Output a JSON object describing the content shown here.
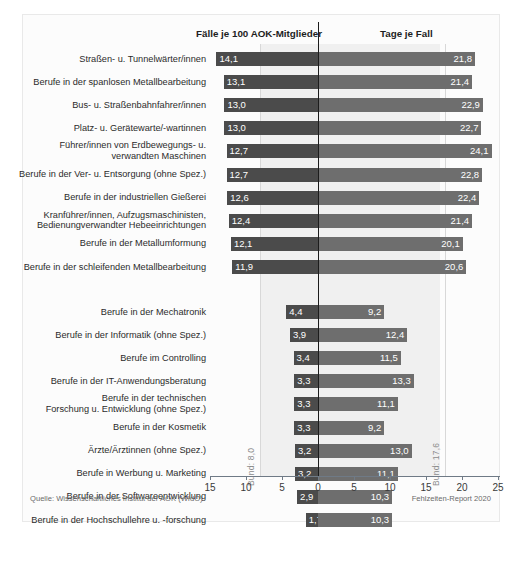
{
  "figure": {
    "headers": {
      "cases": "Fälle je 100 AOK-Mitglieder",
      "days": "Tage je Fall"
    },
    "source": "Quelle: Wissenschaftliches Institut der AOK (WIdO)",
    "report": "Fehlzeiten-Report 2020",
    "bund": {
      "cases_label": "Bund: 8,0",
      "days_label": "Bund: 17,6",
      "cases_value": 8.0,
      "days_value": 17.6
    },
    "colors": {
      "bar_left": "#4b4b4b",
      "bar_right": "#6e6e6e",
      "band": "#f0f0f0",
      "axis": "#6f7a86",
      "zero_axis": "#1c1c1c",
      "frame": "#e9e9e9"
    }
  },
  "chart_data": {
    "type": "bar",
    "title": "",
    "subtitle": "",
    "orientation": "horizontal",
    "layout": "diverging-bidirectional",
    "grid": false,
    "legend": "none",
    "xlabel_left": "Fälle je 100 AOK-Mitglieder",
    "xlabel_right": "Tage je Fall",
    "ylabel": "",
    "left_axis": {
      "ticks": [
        15,
        10,
        5,
        0
      ],
      "tick_labels": [
        "15",
        "10",
        "5",
        "0"
      ],
      "range": [
        15,
        0
      ],
      "direction": "right-to-left"
    },
    "right_axis": {
      "ticks": [
        0,
        5,
        10,
        15,
        20,
        25
      ],
      "tick_labels": [
        "0",
        "5",
        "10",
        "15",
        "20",
        "25"
      ],
      "range": [
        0,
        25
      ],
      "direction": "left-to-right"
    },
    "reference_lines": [
      {
        "name": "Bund (Fälle je 100 AOK-Mitglieder)",
        "axis": "left",
        "value": 8.0,
        "label": "Bund: 8,0"
      },
      {
        "name": "Bund (Tage je Fall)",
        "axis": "right",
        "value": 17.6,
        "label": "Bund: 17,6"
      }
    ],
    "series": [
      {
        "name": "Fälle je 100 AOK-Mitglieder",
        "axis": "left",
        "color": "#4b4b4b"
      },
      {
        "name": "Tage je Fall",
        "axis": "right",
        "color": "#6e6e6e"
      }
    ],
    "groups": [
      {
        "name": "Berufsgruppen mit hohen Fallzahlen",
        "categories": [
          "Straßen- u. Tunnelwärter/innen",
          "Berufe in der spanlosen Metallbearbeitung",
          "Bus- u. Straßenbahnfahrer/innen",
          "Platz- u. Gerätewarte/-wartinnen",
          "Führer/innen von Erdbewegungs- u.\nverwandten Maschinen",
          "Berufe in der Ver- u. Entsorgung (ohne Spez.)",
          "Berufe in der industriellen Gießerei",
          "Kranführer/innen, Aufzugsmaschinisten,\nBedienungverwandter Hebeeinrichtungen",
          "Berufe in der Metallumformung",
          "Berufe in der schleifenden Metallbearbeitung"
        ],
        "cases": [
          14.1,
          13.1,
          13.0,
          13.0,
          12.7,
          12.7,
          12.6,
          12.4,
          12.1,
          11.9
        ],
        "cases_labels": [
          "14,1",
          "13,1",
          "13,0",
          "13,0",
          "12,7",
          "12,7",
          "12,6",
          "12,4",
          "12,1",
          "11,9"
        ],
        "days": [
          21.8,
          21.4,
          22.9,
          22.7,
          24.1,
          22.8,
          22.4,
          21.4,
          20.1,
          20.6
        ],
        "days_labels": [
          "21,8",
          "21,4",
          "22,9",
          "22,7",
          "24,1",
          "22,8",
          "22,4",
          "21,4",
          "20,1",
          "20,6"
        ]
      },
      {
        "name": "Berufsgruppen mit niedrigen Fallzahlen",
        "categories": [
          "Berufe in der Mechatronik",
          "Berufe in der Informatik (ohne Spez.)",
          "Berufe im Controlling",
          "Berufe in der IT-Anwendungsberatung",
          "Berufe in der technischen\nForschung u. Entwicklung (ohne Spez.)",
          "Berufe in der Kosmetik",
          "Ärzte/Ärztinnen (ohne Spez.)",
          "Berufe in Werbung u. Marketing",
          "Berufe in der Softwareentwicklung",
          "Berufe in der Hochschullehre u. -forschung"
        ],
        "cases": [
          4.4,
          3.9,
          3.4,
          3.3,
          3.3,
          3.3,
          3.2,
          3.2,
          2.9,
          1.7
        ],
        "cases_labels": [
          "4,4",
          "3,9",
          "3,4",
          "3,3",
          "3,3",
          "3,3",
          "3,2",
          "3,2",
          "2,9",
          "1,7"
        ],
        "days": [
          9.2,
          12.4,
          11.5,
          13.3,
          11.1,
          9.2,
          13.0,
          11.1,
          10.3,
          10.3
        ],
        "days_labels": [
          "9,2",
          "12,4",
          "11,5",
          "13,3",
          "11,1",
          "9,2",
          "13,0",
          "11,1",
          "10,3",
          "10,3"
        ]
      }
    ]
  }
}
